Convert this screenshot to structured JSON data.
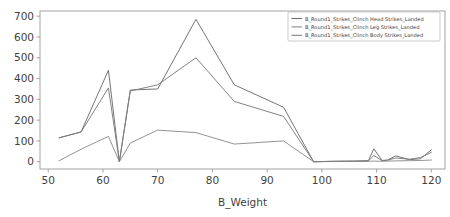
{
  "chart_data": {
    "type": "line",
    "title": "",
    "xlabel": "B_Weight",
    "ylabel": "",
    "xlim": [
      48.5,
      122.5
    ],
    "ylim": [
      -35,
      725
    ],
    "grid": false,
    "legend_position": "upper right",
    "xticks": [
      50,
      60,
      70,
      80,
      90,
      100,
      110,
      120
    ],
    "xtick_labels": [
      "50",
      "60",
      "70",
      "80",
      "90",
      "100",
      "110",
      "120"
    ],
    "yticks": [
      0,
      100,
      200,
      300,
      400,
      500,
      600,
      700
    ],
    "ytick_labels": [
      "0",
      "100",
      "200",
      "300",
      "400",
      "500",
      "600",
      "700"
    ],
    "x": [
      52,
      56,
      61,
      63,
      65,
      70,
      77,
      84,
      93,
      98.5,
      102,
      106,
      108.5,
      109.5,
      111,
      112,
      113.5,
      116,
      118,
      120
    ],
    "series": [
      {
        "name": "B_Round1_Strikes_Clinch Head Strikes_Landed",
        "color": "#6e6e6e",
        "values": [
          115,
          143,
          440,
          0,
          345,
          350,
          685,
          370,
          262,
          0,
          2,
          3,
          5,
          62,
          6,
          8,
          28,
          10,
          14,
          57
        ]
      },
      {
        "name": "B_Round1_Strikes_Clinch Leg Strikes_Landed",
        "color": "#8d8d8d",
        "values": [
          5,
          60,
          122,
          0,
          90,
          152,
          140,
          85,
          100,
          0,
          1,
          1,
          2,
          3,
          2,
          3,
          4,
          5,
          6,
          8
        ]
      },
      {
        "name": "B_Round1_Strikes_Clinch Body Strikes_Landed",
        "color": "#7c7c7c",
        "values": [
          115,
          143,
          355,
          0,
          340,
          370,
          500,
          290,
          218,
          0,
          2,
          3,
          4,
          30,
          5,
          7,
          18,
          12,
          20,
          45
        ]
      }
    ]
  },
  "legend": {
    "entries": [
      "B_Round1_Strikes_Clinch Head Strikes_Landed",
      "B_Round1_Strikes_Clinch Leg Strikes_Landed",
      "B_Round1_Strikes_Clinch Body Strikes_Landed"
    ]
  },
  "axes": {
    "xlabel": "B_Weight"
  }
}
